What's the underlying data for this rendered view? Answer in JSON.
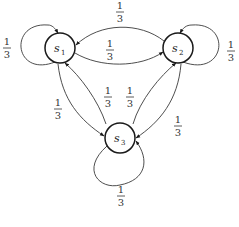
{
  "diagram": {
    "type": "markov-chain-state-diagram",
    "colors": {
      "node_stroke": "#1a1a1a",
      "edge_stroke": "#3a3a3a",
      "text": "#222222",
      "background": "#ffffff"
    },
    "nodes": [
      {
        "id": "s1",
        "label": "s",
        "subscript": "1"
      },
      {
        "id": "s2",
        "label": "s",
        "subscript": "2"
      },
      {
        "id": "s3",
        "label": "s",
        "subscript": "3"
      }
    ],
    "edges": [
      {
        "from": "s1",
        "to": "s1",
        "numerator": "1",
        "denominator": "3"
      },
      {
        "from": "s2",
        "to": "s2",
        "numerator": "1",
        "denominator": "3"
      },
      {
        "from": "s3",
        "to": "s3",
        "numerator": "1",
        "denominator": "3"
      },
      {
        "from": "s2",
        "to": "s1",
        "numerator": "1",
        "denominator": "3"
      },
      {
        "from": "s1",
        "to": "s2",
        "numerator": "1",
        "denominator": "3"
      },
      {
        "from": "s1",
        "to": "s3",
        "numerator": "1",
        "denominator": "3"
      },
      {
        "from": "s3",
        "to": "s1",
        "numerator": "1",
        "denominator": "3"
      },
      {
        "from": "s3",
        "to": "s2",
        "numerator": "1",
        "denominator": "3"
      },
      {
        "from": "s2",
        "to": "s3",
        "numerator": "1",
        "denominator": "3"
      }
    ]
  }
}
